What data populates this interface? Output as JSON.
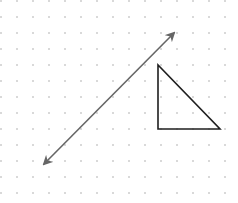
{
  "canvas": {
    "width": 238,
    "height": 203,
    "background": "#ffffff",
    "grid": {
      "type": "dots",
      "spacing": 16,
      "dot_color": "#d9d9d9"
    }
  },
  "shapes": {
    "arrow": {
      "type": "double-headed-arrow",
      "start": [
        44,
        164
      ],
      "end": [
        174,
        33
      ],
      "stroke": "#666666",
      "stroke_width": 1.6
    },
    "triangle": {
      "type": "right-triangle",
      "points": [
        [
          158,
          65
        ],
        [
          158,
          129
        ],
        [
          220,
          129
        ]
      ],
      "stroke": "#1f1f1f",
      "stroke_width": 1.6,
      "fill": "none"
    }
  }
}
